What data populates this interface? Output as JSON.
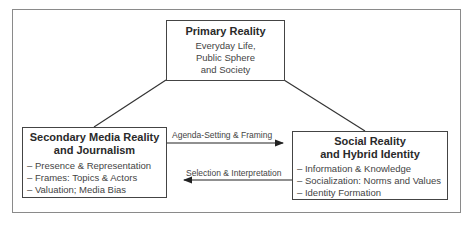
{
  "diagram": {
    "primary": {
      "title": "Primary Reality",
      "lines": [
        "Everyday Life,",
        "Public Sphere",
        "and Society"
      ]
    },
    "secondary": {
      "title_line1": "Secondary Media Reality",
      "title_line2": "and Journalism",
      "items": [
        "– Presence & Representation",
        "– Frames: Topics & Actors",
        "– Valuation; Media Bias"
      ]
    },
    "social": {
      "title_line1": "Social Reality",
      "title_line2": "and Hybrid Identity",
      "items": [
        "– Information & Knowledge",
        "– Socialization: Norms and Values",
        "– Identity Formation"
      ]
    },
    "arrows": {
      "forward_label": "Agenda-Setting & Framing",
      "backward_label": "Selection & Interpretation"
    }
  }
}
